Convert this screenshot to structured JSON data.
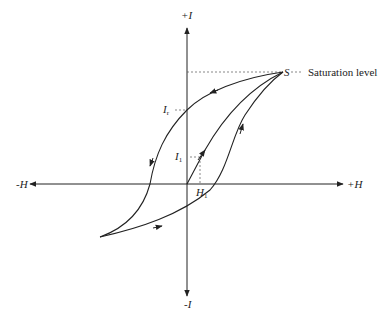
{
  "diagram": {
    "colors": {
      "line": "#222222",
      "dashed": "#555555",
      "background": "#ffffff"
    },
    "axes": {
      "y_positive": "+I",
      "y_negative": "-I",
      "x_positive": "+H",
      "x_negative": "-H"
    },
    "points": {
      "saturation": {
        "label": "S",
        "annotation": "Saturation level"
      },
      "remanence": {
        "label": "I",
        "subscript": "r"
      },
      "initial_I": {
        "label": "I",
        "subscript": "1"
      },
      "initial_H": {
        "label": "H",
        "subscript": "1"
      }
    },
    "curves": [
      {
        "name": "initial-magnetization-curve",
        "from": "origin",
        "to": "S"
      },
      {
        "name": "descending-branch",
        "from": "S",
        "to": "negative-tip",
        "passes": "I_r"
      },
      {
        "name": "ascending-branch",
        "from": "negative-tip",
        "to": "S",
        "passes": "H_1"
      }
    ]
  }
}
